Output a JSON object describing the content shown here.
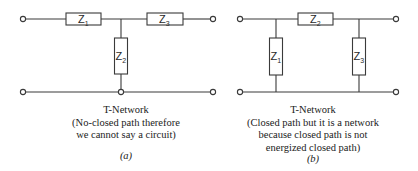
{
  "diagrams": [
    {
      "id": "a",
      "impedances": [
        {
          "symbol": "Z",
          "sub": "1"
        },
        {
          "symbol": "Z",
          "sub": "2"
        },
        {
          "symbol": "Z",
          "sub": "3"
        }
      ],
      "caption": {
        "title": "T-Network",
        "lines": [
          "(No-closed path therefore",
          "we cannot say a circuit)"
        ]
      },
      "tag": "(a)"
    },
    {
      "id": "b",
      "impedances": [
        {
          "symbol": "Z",
          "sub": "1"
        },
        {
          "symbol": "Z",
          "sub": "2"
        },
        {
          "symbol": "Z",
          "sub": "3"
        }
      ],
      "caption": {
        "title": "T-Network",
        "lines": [
          "(Closed path but it is a network",
          "because closed path is not",
          "energized closed path)"
        ]
      },
      "tag": "(b)"
    }
  ]
}
